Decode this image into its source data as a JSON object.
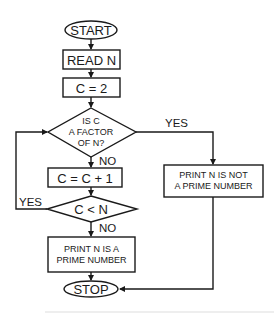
{
  "flowchart": {
    "start": "START",
    "read": "READ N",
    "init": "C = 2",
    "decision1": [
      "IS C",
      "A FACTOR",
      "OF N?"
    ],
    "decision1_yes": "YES",
    "decision1_no": "NO",
    "increment": "C = C + 1",
    "decision2": "C < N",
    "decision2_yes": "YES",
    "decision2_no": "NO",
    "print_prime": [
      "PRINT N IS A",
      "PRIME NUMBER"
    ],
    "print_not_prime": [
      "PRINT N IS NOT",
      "A PRIME NUMBER"
    ],
    "stop": "STOP"
  },
  "colors": {
    "line": "#1a1a1a",
    "background": "#ffffff"
  }
}
